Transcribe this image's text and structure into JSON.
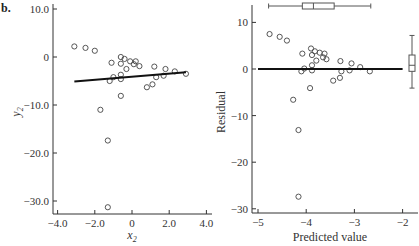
{
  "panel_label": "b.",
  "chart_data": [
    {
      "type": "scatter",
      "title": "",
      "xlabel": "x2",
      "ylabel": "y2",
      "xlim": [
        -4.5,
        4.1
      ],
      "ylim": [
        -32.5,
        10.5
      ],
      "xticks": [
        -4.0,
        -2.0,
        0,
        2.0,
        4.0
      ],
      "xtick_labels": [
        "-4.0",
        "-2.0",
        "0",
        "2.0",
        "4.0"
      ],
      "yticks": [
        10.0,
        0,
        -10.0,
        -20.0,
        -30.0
      ],
      "ytick_labels": [
        "10.0",
        "0",
        "-10.0",
        "-20.0",
        "-30.0"
      ],
      "grid": false,
      "points": [
        [
          -3.1,
          2.2
        ],
        [
          -2.5,
          1.9
        ],
        [
          -2.0,
          1.3
        ],
        [
          -1.1,
          -1.2
        ],
        [
          -0.6,
          0.0
        ],
        [
          -0.4,
          -0.4
        ],
        [
          -0.6,
          -1.4
        ],
        [
          -0.3,
          -2.5
        ],
        [
          -0.1,
          -0.9
        ],
        [
          0.2,
          -0.9
        ],
        [
          0.1,
          -1.5
        ],
        [
          0.4,
          -1.9
        ],
        [
          1.2,
          -2.0
        ],
        [
          1.8,
          -2.5
        ],
        [
          2.3,
          -3.0
        ],
        [
          2.9,
          -3.5
        ],
        [
          -1.0,
          -4.2
        ],
        [
          -1.2,
          -5.0
        ],
        [
          -0.6,
          -3.7
        ],
        [
          -0.6,
          -4.6
        ],
        [
          1.3,
          -4.2
        ],
        [
          1.7,
          -3.9
        ],
        [
          0.8,
          -6.3
        ],
        [
          1.1,
          -5.7
        ],
        [
          -0.6,
          -8.1
        ],
        [
          -1.7,
          -11.0
        ],
        [
          -1.3,
          -17.4
        ],
        [
          -1.3,
          -31.3
        ]
      ],
      "fit_line": {
        "x": [
          -3.1,
          2.9
        ],
        "y": [
          -5.1,
          -3.2
        ]
      }
    },
    {
      "type": "scatter",
      "title": "",
      "xlabel": "Predicted value",
      "ylabel": "Residual",
      "xlim": [
        -5.04,
        -1.8
      ],
      "ylim": [
        -31.5,
        14
      ],
      "xticks": [
        -5,
        -4,
        -3,
        -2
      ],
      "xtick_labels": [
        "-5",
        "-4",
        "-3",
        "-2"
      ],
      "yticks": [
        10,
        0,
        -10,
        -20,
        -30
      ],
      "ytick_labels": [
        "10",
        "0",
        "-10",
        "-20",
        "-30"
      ],
      "grid": false,
      "points": [
        [
          -4.76,
          7.5
        ],
        [
          -4.55,
          6.9
        ],
        [
          -4.4,
          6.1
        ],
        [
          -3.9,
          4.4
        ],
        [
          -3.82,
          3.8
        ],
        [
          -3.72,
          3.5
        ],
        [
          -3.62,
          3.3
        ],
        [
          -3.88,
          3.0
        ],
        [
          -4.08,
          3.3
        ],
        [
          -3.65,
          2.5
        ],
        [
          -3.58,
          2.1
        ],
        [
          -3.79,
          1.8
        ],
        [
          -3.29,
          1.7
        ],
        [
          -3.06,
          1.2
        ],
        [
          -2.88,
          0.4
        ],
        [
          -3.88,
          0.8
        ],
        [
          -4.04,
          0.1
        ],
        [
          -4.1,
          -0.5
        ],
        [
          -3.88,
          -0.3
        ],
        [
          -3.27,
          -0.5
        ],
        [
          -3.1,
          -0.3
        ],
        [
          -2.68,
          -0.5
        ],
        [
          -3.44,
          -2.5
        ],
        [
          -3.3,
          -1.9
        ],
        [
          -3.92,
          -4.1
        ],
        [
          -4.27,
          -6.6
        ],
        [
          -4.16,
          -13.1
        ],
        [
          -4.16,
          -27.4
        ]
      ],
      "zero_line": {
        "x": [
          -5.0,
          -2.0
        ],
        "y": [
          0,
          0
        ]
      },
      "top_boxplot": {
        "whisker_low": -4.78,
        "q1": -4.08,
        "median": -3.85,
        "q3": -3.42,
        "whisker_high": -2.66
      },
      "right_boxplot": {
        "whisker_high": 7.2,
        "q3": 3.0,
        "median": 0.8,
        "q1": -0.5,
        "whisker_low": -4.1
      }
    }
  ]
}
